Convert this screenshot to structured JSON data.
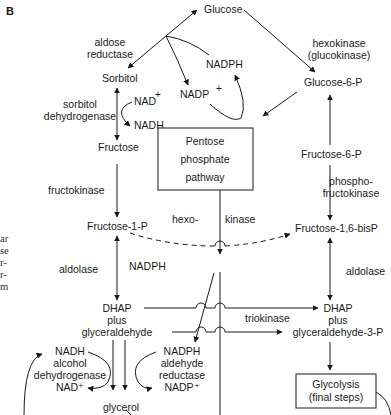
{
  "panel_label": "B",
  "margin_fragments": [
    "ar",
    "se",
    "r-",
    "r-",
    "m"
  ],
  "metabolites": {
    "glucose": "Glucose",
    "sorbitol": "Sorbitol",
    "fructose": "Fructose",
    "fructose_1_p": "Fructose-1-P",
    "glucose_6_p": "Glucose-6-P",
    "fructose_6_p": "Fructose-6-P",
    "fructose_16_bisp": "Fructose-1,6-bisP",
    "nadph_top": "NADPH",
    "nadp_top": "NADP",
    "nad_sorbitol": "NAD",
    "nadh_sorbitol": "NADH",
    "nadph_mid": "NADPH",
    "dhap_left": [
      "DHAP",
      "plus",
      "glyceraldehyde"
    ],
    "dhap_right": [
      "DHAP",
      "plus",
      "glyceraldehyde-3-P"
    ],
    "glycerol": "glycerol",
    "alcohol_dh_block": [
      "NADH",
      "alcohol",
      "dehydrogenase",
      "NAD⁺"
    ],
    "aldehyde_red_block": [
      "NADPH",
      "aldehyde",
      "reductase",
      "NADP⁺"
    ]
  },
  "superscript_plus": "+",
  "enzymes": {
    "aldose_reductase": [
      "aldose",
      "reductase"
    ],
    "sorbitol_dehydrogenase": [
      "sorbitol",
      "dehydrogenase"
    ],
    "fructokinase": "fructokinase",
    "aldolase_left": "aldolase",
    "hexokinase": [
      "hexokinase",
      "(glucokinase)"
    ],
    "phosphofructokinase": [
      "phospho-",
      "fructokinase"
    ],
    "aldolase_right": "aldolase",
    "hexo_kinase": [
      "hexo-",
      "kinase"
    ],
    "triokinase": "triokinase"
  },
  "boxes": {
    "pentose_phosphate": [
      "Pentose",
      "phosphate",
      "pathway"
    ],
    "glycolysis": [
      "Glycolysis",
      "(final steps)"
    ]
  }
}
